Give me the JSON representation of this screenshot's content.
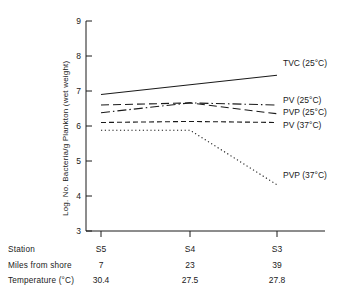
{
  "chart_data": {
    "type": "line",
    "title": "",
    "xlabel": "",
    "ylabel": "Log. No. Bacteria/g Plankton (wet weight)",
    "ylim": [
      3,
      9
    ],
    "yticks": [
      3,
      4,
      5,
      6,
      7,
      8,
      9
    ],
    "ytick_labels": [
      "3",
      "4",
      "5",
      "6",
      "7",
      "8",
      "9"
    ],
    "categories": [
      "S5",
      "S4",
      "S3"
    ],
    "grid": false,
    "legend_position": "right-inline",
    "series": [
      {
        "name": "TVC (25°C)",
        "style": "solid",
        "values": [
          6.9,
          7.18,
          7.45
        ]
      },
      {
        "name": "PV (25°C)",
        "style": "dash-dot",
        "values": [
          6.38,
          6.66,
          6.6
        ]
      },
      {
        "name": "PVP (25°C)",
        "style": "long-dash",
        "values": [
          6.6,
          6.66,
          6.35
        ]
      },
      {
        "name": "PV (37°C)",
        "style": "short-dash",
        "values": [
          6.1,
          6.13,
          6.1
        ]
      },
      {
        "name": "PVP (37°C)",
        "style": "dotted",
        "values": [
          5.88,
          5.88,
          4.32
        ]
      }
    ]
  },
  "axis": {
    "y_title": "Log. No. Bacteria/g Plankton (wet weight)",
    "y_ticks": [
      "9",
      "8",
      "7",
      "6",
      "5",
      "4",
      "3"
    ]
  },
  "legend": {
    "items": [
      {
        "label": "TVC (25°C)"
      },
      {
        "label": "PV (25°C)"
      },
      {
        "label": "PVP (25°C)"
      },
      {
        "label": "PV (37°C)"
      },
      {
        "label": "PVP (37°C)"
      }
    ]
  },
  "data_table": {
    "rows": [
      {
        "header": "Station",
        "cells": [
          "S5",
          "S4",
          "S3"
        ]
      },
      {
        "header": "Miles from shore",
        "cells": [
          "7",
          "23",
          "39"
        ]
      },
      {
        "header": "Temperature (°C)",
        "cells": [
          "30.4",
          "27.5",
          "27.8"
        ]
      }
    ]
  }
}
